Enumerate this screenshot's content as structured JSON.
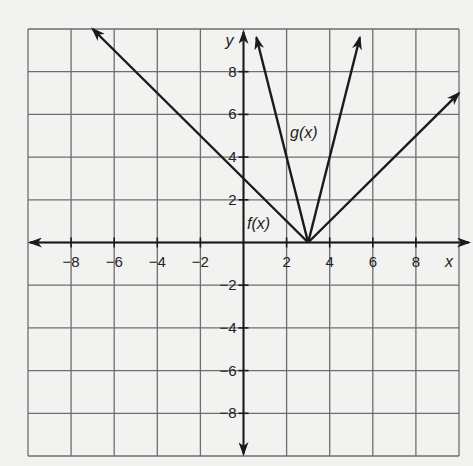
{
  "chart_data": {
    "type": "line",
    "title": "",
    "xlabel": "x",
    "ylabel": "y",
    "xlim": [
      -10,
      10
    ],
    "ylim": [
      -10,
      10
    ],
    "grid": true,
    "grid_step": 2,
    "x_ticks": [
      "-8",
      "-6",
      "-4",
      "-2",
      "2",
      "4",
      "6",
      "8"
    ],
    "y_ticks": [
      "8",
      "6",
      "4",
      "2",
      "-2",
      "-4",
      "-6",
      "-8"
    ],
    "series": [
      {
        "name": "f(x)",
        "label": "f(x)",
        "equation": "f(x) = |x - 3|",
        "vertex": [
          3,
          0
        ],
        "points": [
          [
            -7,
            10
          ],
          [
            3,
            0
          ],
          [
            10,
            7
          ]
        ]
      },
      {
        "name": "g(x)",
        "label": "g(x)",
        "equation": "g(x) = 4|x - 3|",
        "vertex": [
          3,
          0
        ],
        "points": [
          [
            0.6,
            9.6
          ],
          [
            3,
            0
          ],
          [
            5.4,
            9.6
          ]
        ]
      }
    ],
    "legend": "inline labels"
  },
  "labels": {
    "x_axis": "x",
    "y_axis": "y",
    "f": "f(x)",
    "g": "g(x)"
  }
}
